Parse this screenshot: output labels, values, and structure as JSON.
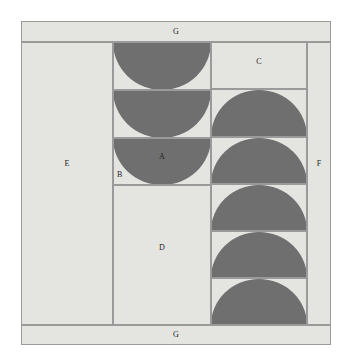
{
  "figure": {
    "title": "",
    "background_color": "#ffffff",
    "panel_color": "#e4e4e1",
    "shape_color": "#6f6f6f",
    "line_color": "#9a9a9a",
    "labels": {
      "a": "A",
      "b": "B",
      "c": "C",
      "d": "D",
      "e": "E",
      "f": "F",
      "g_top": "G",
      "g_bottom": "G"
    },
    "regions": [
      {
        "key": "g_top",
        "label": "G",
        "x": 21,
        "y": 21,
        "w": 310,
        "h": 21,
        "fill": "plain"
      },
      {
        "key": "e",
        "label": "E",
        "x": 21,
        "y": 42,
        "w": 92,
        "h": 283,
        "fill": "plain"
      },
      {
        "key": "mid_1",
        "label": "",
        "x": 113,
        "y": 42,
        "w": 98,
        "h": 48,
        "fill": "semi-down"
      },
      {
        "key": "mid_2",
        "label": "",
        "x": 113,
        "y": 90,
        "w": 98,
        "h": 48,
        "fill": "semi-down"
      },
      {
        "key": "mid_3",
        "label": "A",
        "x": 113,
        "y": 138,
        "w": 98,
        "h": 47,
        "fill": "semi-down"
      },
      {
        "key": "d",
        "label": "D",
        "x": 113,
        "y": 185,
        "w": 98,
        "h": 140,
        "fill": "plain"
      },
      {
        "key": "c",
        "label": "C",
        "x": 211,
        "y": 42,
        "w": 96,
        "h": 47,
        "fill": "plain"
      },
      {
        "key": "right_1",
        "label": "",
        "x": 211,
        "y": 89,
        "w": 96,
        "h": 48,
        "fill": "semi-up"
      },
      {
        "key": "right_2",
        "label": "",
        "x": 211,
        "y": 137,
        "w": 96,
        "h": 47,
        "fill": "semi-up"
      },
      {
        "key": "right_3",
        "label": "",
        "x": 211,
        "y": 184,
        "w": 96,
        "h": 47,
        "fill": "semi-up"
      },
      {
        "key": "right_4",
        "label": "",
        "x": 211,
        "y": 231,
        "w": 96,
        "h": 47,
        "fill": "semi-up"
      },
      {
        "key": "right_5",
        "label": "",
        "x": 211,
        "y": 278,
        "w": 96,
        "h": 47,
        "fill": "semi-up"
      },
      {
        "key": "f",
        "label": "F",
        "x": 307,
        "y": 42,
        "w": 24,
        "h": 283,
        "fill": "plain"
      },
      {
        "key": "g_bottom",
        "label": "G",
        "x": 21,
        "y": 325,
        "w": 310,
        "h": 20,
        "fill": "plain"
      }
    ]
  }
}
